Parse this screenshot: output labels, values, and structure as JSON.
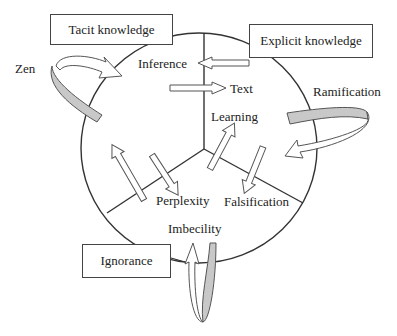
{
  "diagram": {
    "boxes": {
      "tacit": "Tacit knowledge",
      "explicit": "Explicit knowledge",
      "ignorance": "Ignorance"
    },
    "outer_labels": {
      "zen": "Zen",
      "ramification": "Ramification"
    },
    "inner_labels": {
      "inference": "Inference",
      "text": "Text",
      "learning": "Learning",
      "perplexity": "Perplexity",
      "falsification": "Falsification",
      "imbecility": "Imbecility"
    },
    "colors": {
      "stroke": "#333333",
      "ribbon_fill": "#c8c8c8",
      "arrow_fill": "#ffffff",
      "background": "#ffffff"
    }
  }
}
